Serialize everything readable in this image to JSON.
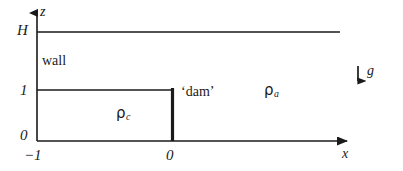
{
  "figure": {
    "kind": "lock-exchange-dam-break-schematic",
    "width": 403,
    "height": 171,
    "background": "#ffffff",
    "line_color": "#1a1a1a"
  },
  "axes": {
    "vertical": {
      "name": "z-axis",
      "label": "z",
      "arrow": "up",
      "ticks": [
        {
          "label": "H",
          "value": "H"
        },
        {
          "label": "1",
          "value": "1"
        },
        {
          "label": "0",
          "value": "0"
        }
      ]
    },
    "horizontal": {
      "name": "x-axis",
      "label": "x",
      "arrow": "right",
      "ticks": [
        {
          "label": "−1",
          "value": "-1"
        },
        {
          "label": "0",
          "value": "0"
        }
      ]
    }
  },
  "annotations": {
    "wall": "wall",
    "dam": "‘dam’",
    "density_lock": {
      "symbol": "ρ",
      "subscript": "c"
    },
    "density_ambient": {
      "symbol": "ρ",
      "subscript": "a"
    },
    "gravity": {
      "label": "g",
      "direction": "down"
    }
  },
  "geometry": {
    "domain_top_label": "H",
    "lock_height_label": "1",
    "lock_left_label": "-1",
    "dam_position_label": "0"
  }
}
